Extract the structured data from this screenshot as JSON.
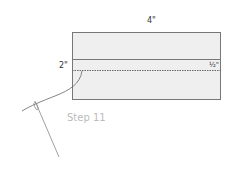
{
  "diagram": {
    "width_label": "4\"",
    "height_label": "2\"",
    "seam_label": "½\"",
    "step_label": "Step 11",
    "colors": {
      "fabric_fill": "#efefef",
      "outline": "#777777",
      "thread": "#666666",
      "step_text": "#bbbbbb"
    }
  }
}
